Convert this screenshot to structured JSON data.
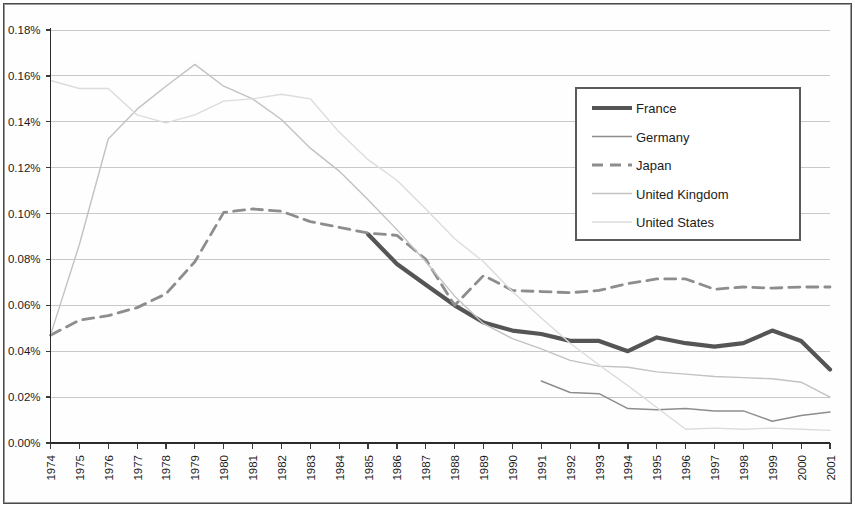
{
  "chart_data": {
    "type": "line",
    "title": "",
    "subtitle": "",
    "xlabel": "",
    "ylabel": "",
    "grid": true,
    "legend_position": "top-right",
    "xlim": [
      1974,
      2001
    ],
    "ylim": [
      0,
      0.18
    ],
    "ytick_labels": [
      "0.18%",
      "0.16%",
      "0.14%",
      "0.12%",
      "0.10%",
      "0.08%",
      "0.06%",
      "0.04%",
      "0.02%",
      "0.00%"
    ],
    "ytick_values": [
      0.18,
      0.16,
      0.14,
      0.12,
      0.1,
      0.08,
      0.06,
      0.04,
      0.02,
      0.0
    ],
    "categories": [
      "1974",
      "1975",
      "1976",
      "1977",
      "1978",
      "1979",
      "1980",
      "1981",
      "1982",
      "1983",
      "1984",
      "1985",
      "1986",
      "1987",
      "1988",
      "1989",
      "1990",
      "1991",
      "1992",
      "1993",
      "1994",
      "1995",
      "1996",
      "1997",
      "1998",
      "1999",
      "2000",
      "2001"
    ],
    "series": [
      {
        "name": "France",
        "color": "#555555",
        "width": 4.2,
        "dash": "none",
        "x": [
          1985,
          1986,
          1987,
          1988,
          1989,
          1990,
          1991,
          1992,
          1993,
          1994,
          1995,
          1996,
          1997,
          1998,
          1999,
          2000,
          2001
        ],
        "values": [
          0.091,
          0.078,
          0.069,
          0.06,
          0.0525,
          0.049,
          0.0475,
          0.0445,
          0.0445,
          0.04,
          0.046,
          0.0435,
          0.042,
          0.0435,
          0.049,
          0.0445,
          0.032
        ]
      },
      {
        "name": "Germany",
        "color": "#8d8d8d",
        "width": 1.5,
        "dash": "none",
        "x": [
          1991,
          1992,
          1993,
          1994,
          1995,
          1996,
          1997,
          1998,
          1999,
          2000,
          2001
        ],
        "values": [
          0.027,
          0.022,
          0.0215,
          0.015,
          0.0145,
          0.015,
          0.014,
          0.014,
          0.0095,
          0.012,
          0.0135
        ]
      },
      {
        "name": "Japan",
        "color": "#8d8d8d",
        "width": 2.8,
        "dash": "11,7",
        "x": [
          1974,
          1975,
          1976,
          1977,
          1978,
          1979,
          1980,
          1981,
          1982,
          1983,
          1984,
          1985,
          1986,
          1987,
          1988,
          1989,
          1990,
          1991,
          1992,
          1993,
          1994,
          1995,
          1996,
          1997,
          1998,
          1999,
          2000,
          2001
        ],
        "values": [
          0.047,
          0.0535,
          0.0555,
          0.059,
          0.065,
          0.079,
          0.1005,
          0.102,
          0.101,
          0.0965,
          0.094,
          0.0915,
          0.0905,
          0.08,
          0.06,
          0.073,
          0.0665,
          0.066,
          0.0655,
          0.0665,
          0.0695,
          0.0715,
          0.0715,
          0.067,
          0.068,
          0.0675,
          0.068,
          0.068
        ]
      },
      {
        "name": "United Kingdom",
        "color": "#c2c2c2",
        "width": 1.4,
        "dash": "none",
        "x": [
          1974,
          1975,
          1976,
          1977,
          1978,
          1979,
          1980,
          1981,
          1982,
          1983,
          1984,
          1985,
          1986,
          1987,
          1988,
          1989,
          1990,
          1991,
          1992,
          1993,
          1994,
          1995,
          1996,
          1997,
          1998,
          1999,
          2000,
          2001
        ],
        "values": [
          0.047,
          0.0865,
          0.1325,
          0.1455,
          0.1555,
          0.165,
          0.1555,
          0.15,
          0.141,
          0.1285,
          0.1185,
          0.106,
          0.093,
          0.079,
          0.064,
          0.052,
          0.0455,
          0.041,
          0.036,
          0.0335,
          0.033,
          0.031,
          0.03,
          0.029,
          0.0285,
          0.028,
          0.0265,
          0.02
        ]
      },
      {
        "name": "United States",
        "color": "#dcdcdc",
        "width": 1.4,
        "dash": "none",
        "x": [
          1974,
          1975,
          1976,
          1977,
          1978,
          1979,
          1980,
          1981,
          1982,
          1983,
          1984,
          1985,
          1986,
          1987,
          1988,
          1989,
          1990,
          1991,
          1992,
          1993,
          1994,
          1995,
          1996,
          1997,
          1998,
          1999,
          2000,
          2001
        ],
        "values": [
          0.158,
          0.1545,
          0.1545,
          0.143,
          0.1395,
          0.143,
          0.149,
          0.15,
          0.152,
          0.15,
          0.1355,
          0.1235,
          0.1145,
          0.102,
          0.089,
          0.079,
          0.066,
          0.0545,
          0.0435,
          0.034,
          0.025,
          0.0155,
          0.006,
          0.0065,
          0.006,
          0.0065,
          0.006,
          0.0055
        ]
      }
    ]
  },
  "legend": {
    "items": [
      {
        "label": "France"
      },
      {
        "label": "Germany"
      },
      {
        "label": "Japan"
      },
      {
        "label": "United Kingdom"
      },
      {
        "label": "United States"
      }
    ]
  }
}
